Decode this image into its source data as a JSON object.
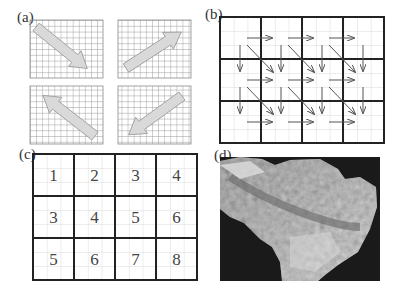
{
  "panels": {
    "a": {
      "label": "(a)",
      "description": "four fine grids each with a large gray arrow",
      "arrows": [
        "down-right",
        "up-right",
        "up-left",
        "down-left"
      ]
    },
    "b": {
      "label": "(b)",
      "description": "4x3 coarse grid with arrows connecting cell centers horizontally, vertically and diagonally"
    },
    "c": {
      "label": "(c)",
      "description": "4x3 coarse grid with numbered cells",
      "rows": [
        [
          "1",
          "2",
          "3",
          "4"
        ],
        [
          "3",
          "4",
          "5",
          "6"
        ],
        [
          "5",
          "6",
          "7",
          "8"
        ]
      ]
    },
    "d": {
      "label": "(d)",
      "description": "grayscale shaded relief terrain map"
    }
  },
  "colors": {
    "grid_fine": "#9a9a9a",
    "grid_light": "#cfcfcf",
    "grid_thick": "#222222",
    "arrow_fill": "#d8d8d8",
    "arrow_line": "#555555",
    "terrain_bg": "#1a1a1a"
  }
}
